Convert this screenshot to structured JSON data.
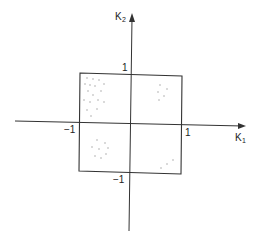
{
  "diagram": {
    "axes": {
      "x_label": "K",
      "x_subscript": "1",
      "y_label": "K",
      "y_subscript": "2"
    },
    "ticks": {
      "x_neg": "−1",
      "x_pos": "1",
      "y_pos": "1",
      "y_neg": "−1"
    },
    "colors": {
      "line": "#333333",
      "dot": "#999999"
    },
    "clusters": [
      {
        "quadrant": "top-left",
        "points": [
          [
            87,
            78
          ],
          [
            93,
            79
          ],
          [
            99,
            80
          ],
          [
            85,
            84
          ],
          [
            90,
            85
          ],
          [
            95,
            86
          ],
          [
            104,
            84
          ],
          [
            88,
            91
          ],
          [
            93,
            95
          ],
          [
            101,
            91
          ],
          [
            84,
            100
          ],
          [
            90,
            102
          ],
          [
            98,
            100
          ],
          [
            104,
            102
          ],
          [
            87,
            110
          ],
          [
            97,
            109
          ],
          [
            91,
            116
          ]
        ]
      },
      {
        "quadrant": "top-right",
        "points": [
          [
            160,
            85
          ],
          [
            167,
            89
          ],
          [
            158,
            92
          ],
          [
            164,
            96
          ],
          [
            159,
            100
          ]
        ]
      },
      {
        "quadrant": "bottom-left",
        "points": [
          [
            97,
            140
          ],
          [
            105,
            143
          ],
          [
            92,
            147
          ],
          [
            99,
            149
          ],
          [
            108,
            148
          ],
          [
            95,
            156
          ],
          [
            101,
            158
          ],
          [
            106,
            154
          ]
        ]
      },
      {
        "quadrant": "bottom-right",
        "points": [
          [
            173,
            160
          ],
          [
            167,
            164
          ],
          [
            161,
            168
          ]
        ]
      }
    ]
  }
}
